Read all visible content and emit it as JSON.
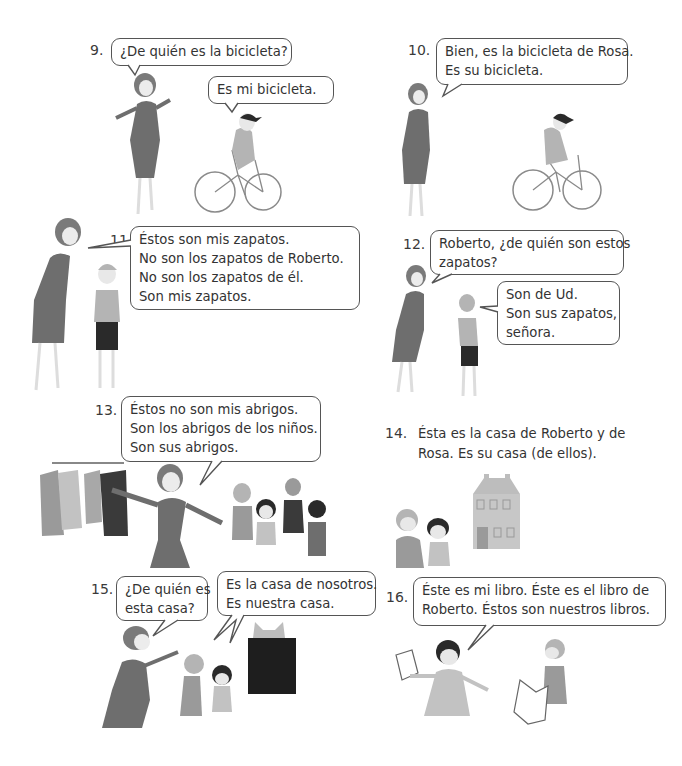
{
  "panels": [
    {
      "number": "9.",
      "bubbles": [
        {
          "lines": [
            "¿De quién es la bicicleta?"
          ]
        },
        {
          "lines": [
            "Es mi bicicleta."
          ]
        }
      ]
    },
    {
      "number": "10.",
      "bubbles": [
        {
          "lines": [
            "Bien, es la bicicleta de Rosa.",
            "Es su bicicleta."
          ]
        }
      ]
    },
    {
      "number": "11.",
      "bubbles": [
        {
          "lines": [
            "Éstos son mis zapatos.",
            "No son los zapatos de Roberto.",
            "No son los zapatos de él.",
            "Son mis zapatos."
          ]
        }
      ]
    },
    {
      "number": "12.",
      "bubbles": [
        {
          "lines": [
            "Roberto, ¿de quién son estos",
            "zapatos?"
          ]
        },
        {
          "lines": [
            "Son de Ud.",
            "Son sus zapatos,",
            "señora."
          ]
        }
      ]
    },
    {
      "number": "13.",
      "bubbles": [
        {
          "lines": [
            "Éstos no son mis abrigos.",
            "Son los abrigos de los niños.",
            "Son sus abrigos."
          ]
        }
      ]
    },
    {
      "number": "14.",
      "caption": [
        "Ésta es la casa de Roberto y de",
        "Rosa. Es su casa (de ellos)."
      ]
    },
    {
      "number": "15.",
      "bubbles": [
        {
          "lines": [
            "¿De quién es",
            "esta casa?"
          ]
        },
        {
          "lines": [
            "Es la casa de nosotros.",
            "Es nuestra casa."
          ]
        }
      ]
    },
    {
      "number": "16.",
      "bubbles": [
        {
          "lines": [
            "Éste es mi libro. Éste es el libro de",
            "Roberto. Éstos son nuestros libros."
          ]
        }
      ]
    }
  ],
  "illustrations": {
    "p9": "woman-and-girl-on-bicycle",
    "p10": "woman-and-girl-on-bicycle",
    "p11": "woman-and-boy",
    "p12": "woman-and-boy-pointing",
    "p13": "woman-coat-rack-children",
    "p14": "two-children-and-house",
    "p15": "woman-children-dark-house",
    "p16": "girl-and-boy-with-books"
  },
  "colors": {
    "dress_dark": "#6e6e6e",
    "hair": "#7a7a7a",
    "skin": "#e8e8e8",
    "light_gray": "#b4b4b4",
    "black": "#2a2a2a",
    "house": "#bdbdbd"
  }
}
